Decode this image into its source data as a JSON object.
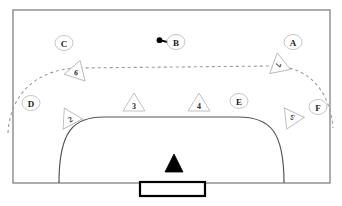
{
  "diagram": {
    "court": {
      "boundary_color": "#8a8a8a",
      "goal_area_color": "#555555",
      "dashed_line_color": "#9a9a9a",
      "goal_color": "#000000",
      "background": "#ffffff",
      "left": 13,
      "top": 10,
      "right": 330,
      "bottom": 183
    },
    "goal": {
      "name": "goal",
      "x": 140,
      "y": 182,
      "width": 65,
      "height": 14,
      "stroke": "#000000"
    },
    "goalkeeper": {
      "name": "goalkeeper-triangle",
      "cx": 174,
      "cy": 163,
      "size": 11,
      "fill": "#000000"
    },
    "position_labels": [
      {
        "id": "A",
        "label": "A",
        "cx": 293,
        "cy": 42,
        "rx": 9,
        "ry": 7.5
      },
      {
        "id": "B",
        "label": "B",
        "cx": 176,
        "cy": 42,
        "rx": 9,
        "ry": 7.5
      },
      {
        "id": "C",
        "label": "C",
        "cx": 64,
        "cy": 43,
        "rx": 9,
        "ry": 7.5
      },
      {
        "id": "D",
        "label": "D",
        "cx": 31,
        "cy": 103,
        "rx": 9,
        "ry": 7.5
      },
      {
        "id": "E",
        "label": "E",
        "cx": 239,
        "cy": 101,
        "rx": 9,
        "ry": 7.5
      },
      {
        "id": "F",
        "label": "F",
        "cx": 318,
        "cy": 107,
        "rx": 9,
        "ry": 7.5
      }
    ],
    "player_markers": [
      {
        "id": "2",
        "label": "2",
        "cx": 69,
        "cy": 117,
        "rotation": -28
      },
      {
        "id": "3",
        "label": "3",
        "cx": 134,
        "cy": 103,
        "rotation": 0
      },
      {
        "id": "4",
        "label": "4",
        "cx": 199,
        "cy": 103,
        "rotation": 0
      },
      {
        "id": "5",
        "label": "5",
        "cx": 291,
        "cy": 120,
        "rotation": 205
      },
      {
        "id": "6",
        "label": "6",
        "cx": 77,
        "cy": 70,
        "rotation": 18
      },
      {
        "id": "7",
        "label": "7",
        "cx": 281,
        "cy": 66,
        "rotation": 110
      }
    ],
    "ball": {
      "name": "ball-marker",
      "cx": 160,
      "cy": 40,
      "r": 2.6,
      "tail_end_x": 169,
      "tail_end_y": 42,
      "fill": "#000000"
    }
  }
}
